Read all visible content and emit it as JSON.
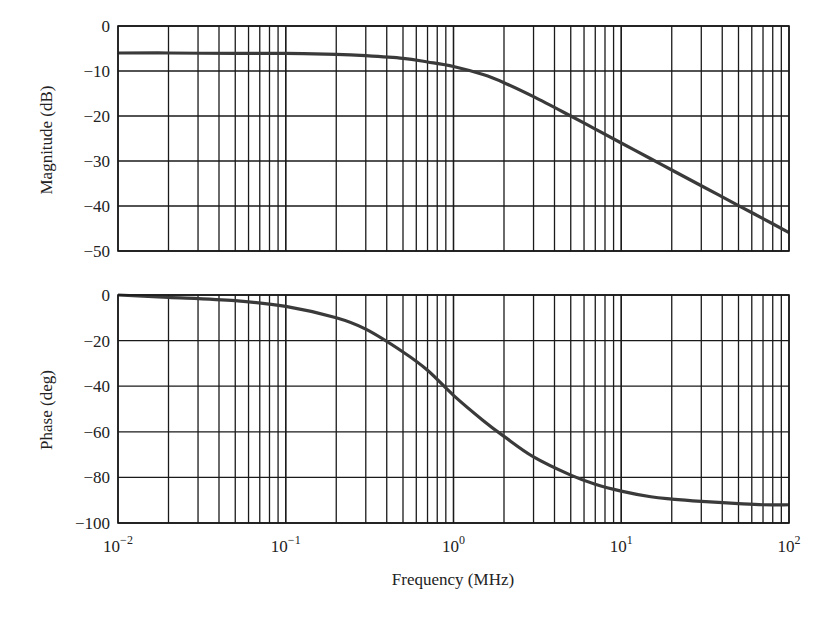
{
  "figure": {
    "xlabel": "Frequency (MHz)",
    "x_tick_labels": [
      {
        "base": "10",
        "exp": "−2"
      },
      {
        "base": "10",
        "exp": "−1"
      },
      {
        "base": "10",
        "exp": "0"
      },
      {
        "base": "10",
        "exp": "1"
      },
      {
        "base": "10",
        "exp": "2"
      }
    ],
    "colors": {
      "grid": "#1a1a1a",
      "curve": "#3a3a3a",
      "frame": "#1a1a1a",
      "background": "#ffffff"
    }
  },
  "chart_data": [
    {
      "type": "line",
      "title": "",
      "xlabel": "Frequency (MHz)",
      "ylabel": "Magnitude (dB)",
      "xscale": "log",
      "xlim": [
        0.01,
        100
      ],
      "ylim": [
        -50,
        0
      ],
      "yticks": [
        0,
        -10,
        -20,
        -30,
        -40,
        -50
      ],
      "ytick_labels": [
        "0",
        "−10",
        "−20",
        "−30",
        "−40",
        "−50"
      ],
      "grid": true,
      "legend": null,
      "series": [
        {
          "name": "Magnitude",
          "x": [
            0.01,
            0.02,
            0.05,
            0.1,
            0.2,
            0.3,
            0.5,
            0.7,
            1,
            1.5,
            2,
            3,
            5,
            7,
            10,
            15,
            20,
            30,
            50,
            70,
            100
          ],
          "values": [
            -6.0,
            -6.0,
            -6.1,
            -6.1,
            -6.3,
            -6.6,
            -7.2,
            -8.0,
            -9.0,
            -10.8,
            -12.6,
            -15.7,
            -20.0,
            -22.9,
            -26.0,
            -29.5,
            -32.0,
            -35.5,
            -39.9,
            -42.8,
            -45.9
          ]
        }
      ]
    },
    {
      "type": "line",
      "title": "",
      "xlabel": "Frequency (MHz)",
      "ylabel": "Phase (deg)",
      "xscale": "log",
      "xlim": [
        0.01,
        100
      ],
      "ylim": [
        -100,
        0
      ],
      "yticks": [
        0,
        -20,
        -40,
        -60,
        -80,
        -100
      ],
      "ytick_labels": [
        "0",
        "−20",
        "−40",
        "−60",
        "−80",
        "−100"
      ],
      "grid": true,
      "legend": null,
      "series": [
        {
          "name": "Phase",
          "x": [
            0.01,
            0.02,
            0.05,
            0.1,
            0.2,
            0.3,
            0.5,
            0.7,
            1,
            1.5,
            2,
            3,
            5,
            7,
            10,
            15,
            20,
            30,
            50,
            70,
            100
          ],
          "values": [
            0,
            -1,
            -2.5,
            -5,
            -10,
            -15,
            -25,
            -33,
            -44,
            -55,
            -62,
            -71,
            -79,
            -83,
            -86,
            -88.5,
            -89.5,
            -90.5,
            -91.5,
            -92,
            -92
          ]
        }
      ]
    }
  ]
}
